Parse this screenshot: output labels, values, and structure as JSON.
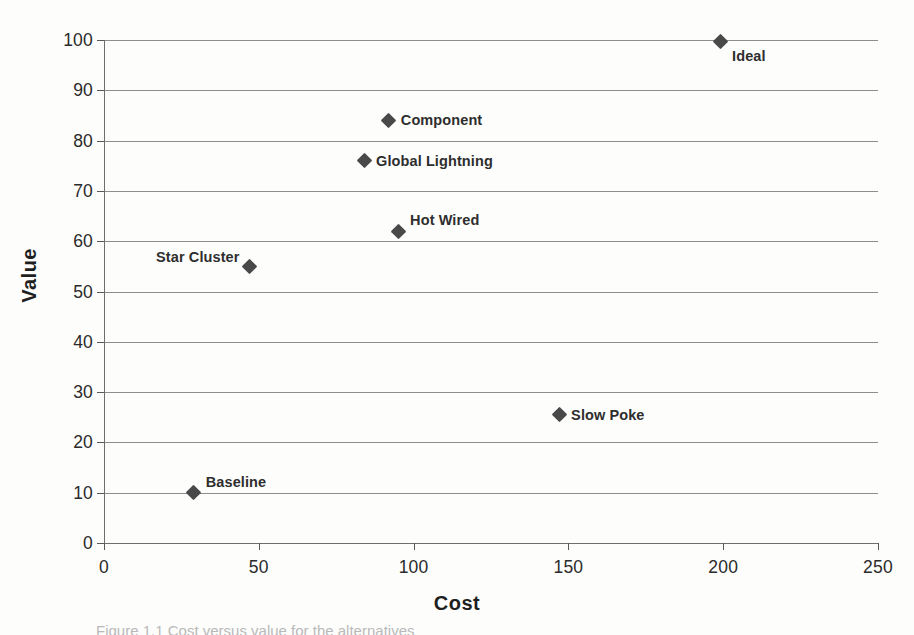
{
  "chart_data": {
    "type": "scatter",
    "title": "",
    "xlabel": "Cost",
    "ylabel": "Value",
    "xlim": [
      0,
      250
    ],
    "ylim": [
      0,
      100
    ],
    "x_ticks": [
      "0",
      "50",
      "100",
      "150",
      "200",
      "250"
    ],
    "x_tick_values": [
      0,
      50,
      100,
      150,
      200,
      250
    ],
    "y_ticks": [
      "0",
      "10",
      "20",
      "30",
      "40",
      "50",
      "60",
      "70",
      "80",
      "90",
      "100"
    ],
    "y_tick_values": [
      0,
      10,
      20,
      30,
      40,
      50,
      60,
      70,
      80,
      90,
      100
    ],
    "grid": "horizontal",
    "legend": "none",
    "marker_shape": "diamond",
    "marker_color": "#494949",
    "points": [
      {
        "label": "Baseline",
        "x": 29,
        "y": 10,
        "label_pos": "right"
      },
      {
        "label": "Star Cluster",
        "x": 47,
        "y": 55,
        "label_pos": "left"
      },
      {
        "label": "Slow Poke",
        "x": 147,
        "y": 25.5,
        "label_pos": "rightm"
      },
      {
        "label": "Hot Wired",
        "x": 95,
        "y": 62,
        "label_pos": "right"
      },
      {
        "label": "Global Lightning",
        "x": 84,
        "y": 76,
        "label_pos": "rightm"
      },
      {
        "label": "Component",
        "x": 92,
        "y": 84,
        "label_pos": "rightm"
      },
      {
        "label": "Ideal",
        "x": 199,
        "y": 99.7,
        "label_pos": "below"
      }
    ]
  },
  "caption": {
    "text": "Figure 1.1  Cost versus value for the alternatives"
  }
}
